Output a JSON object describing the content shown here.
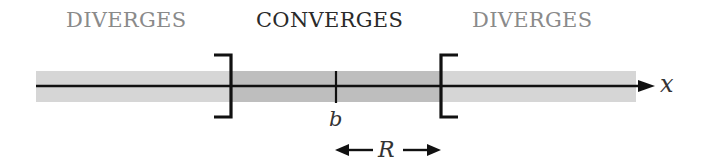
{
  "diagram": {
    "regions": [
      {
        "label": "DIVERGES",
        "kind": "diverges",
        "x_center": 132
      },
      {
        "label": "CONVERGES",
        "kind": "converges",
        "x_center": 336
      },
      {
        "label": "DIVERGES",
        "kind": "diverges",
        "x_center": 539
      }
    ],
    "axis": {
      "label": "x"
    },
    "center": {
      "label": "b"
    },
    "radius": {
      "label": "R"
    },
    "colors": {
      "band_outer": "#d6d6d6",
      "band_inner": "#bebebe",
      "line": "#111111",
      "diverges_text": "#8a8a8a",
      "converges_text": "#2a2a2a"
    }
  }
}
